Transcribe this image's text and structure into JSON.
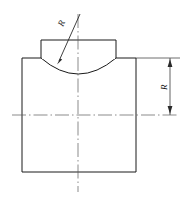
{
  "drawing": {
    "title": "Technical part outline with concave radius",
    "type": "engineering-line-drawing",
    "background_color": "#ffffff",
    "line_color": "#1a1a1a",
    "centerline_color": "#5a5a5a",
    "dimension_color": "#3a3a3a",
    "labels": {
      "radius_leader": "R",
      "radius_vertical": "R"
    },
    "geometry": {
      "body": {
        "left": 22,
        "right": 136,
        "top": 58,
        "bottom": 172,
        "width": 114,
        "height": 114
      },
      "tab": {
        "left": 41,
        "right": 116,
        "top": 40,
        "bottom": 58,
        "width": 75,
        "height": 18
      },
      "arc": {
        "start_x": 41,
        "start_y": 58,
        "end_x": 116,
        "end_y": 58,
        "lowest_x": 78,
        "lowest_y": 74,
        "sagitta": 16,
        "concave": true
      },
      "vertical_centerline": {
        "x": 78,
        "top": 14,
        "bottom": 192
      },
      "horizontal_centerline": {
        "y": 115,
        "left": 12,
        "right": 178
      },
      "leader": {
        "tail_x": 80,
        "tail_y": 14,
        "tip_x": 58,
        "tip_y": 63
      },
      "vertical_dimension": {
        "x": 170,
        "top": 58,
        "bottom": 115,
        "extension_top_y": 58,
        "extension_from_x": 136,
        "extension_to_x": 180
      }
    }
  }
}
